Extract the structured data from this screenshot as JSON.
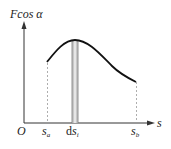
{
  "diagram": {
    "y_label": "Fcos α",
    "x_label": "s",
    "origin_label": "O",
    "tick_labels": {
      "sa": {
        "base": "s",
        "sub": "a"
      },
      "dsi": {
        "prefix": "d",
        "base": "s",
        "sub": "i"
      },
      "sb": {
        "base": "s",
        "sub": "b"
      }
    },
    "colors": {
      "axis": "#333333",
      "curve": "#111111",
      "dashed": "#999999",
      "strip": "#bdbdbd",
      "strip_edge": "#777777"
    }
  }
}
